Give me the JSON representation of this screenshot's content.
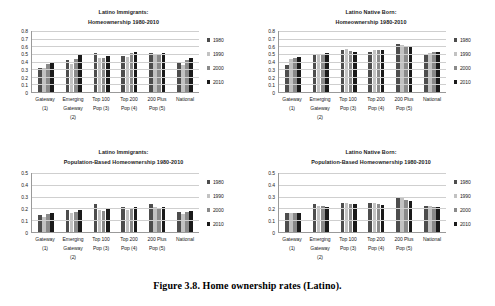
{
  "caption": "Figure 3.8.  Home ownership rates (Latino).",
  "series_colors": {
    "1980": "#4d4d4d",
    "1990": "#c2c2c2",
    "2000": "#8a8a8a",
    "2010": "#1a1a1a"
  },
  "legend": {
    "items": [
      {
        "label": "1980",
        "color": "#4d4d4d"
      },
      {
        "label": "1990",
        "color": "#c2c2c2"
      },
      {
        "label": "2000",
        "color": "#8a8a8a"
      },
      {
        "label": "2010",
        "color": "#1a1a1a"
      }
    ]
  },
  "categories": [
    [
      "Gateway",
      "(1)"
    ],
    [
      "Emerging",
      "Gateway",
      "(2)"
    ],
    [
      "Top 100",
      "Pop (3)"
    ],
    [
      "Top 200",
      "Pop (4)"
    ],
    [
      "200 Plus",
      "Pop (5)"
    ],
    [
      "National"
    ]
  ],
  "chart_data": [
    {
      "id": "latino-immigrants-homeownership",
      "type": "bar",
      "title": "Latino Immigrants: Homeownership 1980-2010",
      "title_lines": [
        "Latino Immigrants:",
        "Homeownership 1980-2010"
      ],
      "xlabel": "",
      "ylabel": "",
      "ylim": [
        0,
        0.8
      ],
      "yticks": [
        0.8,
        0.7,
        0.6,
        0.5,
        0.4,
        0.3,
        0.2,
        0.1,
        0
      ],
      "ytick_labels": [
        "0.8",
        "0.7",
        "0.6",
        "0.5",
        "0.4",
        "0.3",
        "0.2",
        "0.1",
        "0"
      ],
      "grid": true,
      "legend_position": "right",
      "categories": [
        "Gateway (1)",
        "Emerging Gateway (2)",
        "Top 100 Pop (3)",
        "Top 200 Pop (4)",
        "200 Plus Pop (5)",
        "National"
      ],
      "series": [
        {
          "name": "1980",
          "values": [
            0.32,
            0.42,
            0.51,
            0.47,
            0.51,
            0.39
          ]
        },
        {
          "name": "1990",
          "values": [
            0.31,
            0.37,
            0.45,
            0.46,
            0.5,
            0.35
          ]
        },
        {
          "name": "2000",
          "values": [
            0.37,
            0.43,
            0.45,
            0.51,
            0.49,
            0.42
          ]
        },
        {
          "name": "2010",
          "values": [
            0.4,
            0.48,
            0.47,
            0.52,
            0.51,
            0.44
          ]
        }
      ]
    },
    {
      "id": "latino-native-born-homeownership",
      "type": "bar",
      "title": "Latino Native Born: Homeownership 1980-2010",
      "title_lines": [
        "Latino Native Born:",
        "Homeownership 1980-2010"
      ],
      "xlabel": "",
      "ylabel": "",
      "ylim": [
        0,
        0.8
      ],
      "yticks": [
        0.8,
        0.7,
        0.6,
        0.5,
        0.4,
        0.3,
        0.2,
        0.1,
        0
      ],
      "ytick_labels": [
        "0.8",
        "0.7",
        "0.6",
        "0.5",
        "0.4",
        "0.3",
        "0.2",
        "0.1",
        "0"
      ],
      "grid": true,
      "legend_position": "right",
      "categories": [
        "Gateway (1)",
        "Emerging Gateway (2)",
        "Top 100 Pop (3)",
        "Top 200 Pop (4)",
        "200 Plus Pop (5)",
        "National"
      ],
      "series": [
        {
          "name": "1980",
          "values": [
            0.35,
            0.5,
            0.55,
            0.53,
            0.63,
            0.48
          ]
        },
        {
          "name": "1990",
          "values": [
            0.43,
            0.5,
            0.56,
            0.55,
            0.62,
            0.51
          ]
        },
        {
          "name": "2000",
          "values": [
            0.44,
            0.5,
            0.54,
            0.55,
            0.61,
            0.52
          ]
        },
        {
          "name": "2010",
          "values": [
            0.46,
            0.51,
            0.53,
            0.55,
            0.59,
            0.52
          ]
        }
      ]
    },
    {
      "id": "latino-immigrants-population-based",
      "type": "bar",
      "title": "Latino Immigrants: Population-Based Homeownership 1980-2010",
      "title_lines": [
        "Latino Immigrants:",
        "Population-Based Homeownership 1980-2010"
      ],
      "xlabel": "",
      "ylabel": "",
      "ylim": [
        0,
        0.5
      ],
      "yticks": [
        0.5,
        0.4,
        0.3,
        0.2,
        0.1,
        0
      ],
      "ytick_labels": [
        "0.5",
        "0.4",
        "0.3",
        "0.2",
        "0.1",
        "0"
      ],
      "grid": true,
      "legend_position": "right",
      "categories": [
        "Gateway (1)",
        "Emerging Gateway (2)",
        "Top 100 Pop (3)",
        "Top 200 Pop (4)",
        "200 Plus Pop (5)",
        "National"
      ],
      "series": [
        {
          "name": "1980",
          "values": [
            0.14,
            0.19,
            0.24,
            0.21,
            0.24,
            0.17
          ]
        },
        {
          "name": "1990",
          "values": [
            0.13,
            0.16,
            0.19,
            0.185,
            0.21,
            0.15
          ]
        },
        {
          "name": "2000",
          "values": [
            0.15,
            0.17,
            0.18,
            0.2,
            0.2,
            0.17
          ]
        },
        {
          "name": "2010",
          "values": [
            0.16,
            0.19,
            0.195,
            0.21,
            0.21,
            0.18
          ]
        }
      ]
    },
    {
      "id": "latino-native-born-population-based",
      "type": "bar",
      "title": "Latino Native Born: Population-Based Homeownership 1980-2010",
      "title_lines": [
        "Latino Native Born:",
        "Population-Based Homeownership 1980-2010"
      ],
      "xlabel": "",
      "ylabel": "",
      "ylim": [
        0,
        0.5
      ],
      "yticks": [
        0.5,
        0.4,
        0.3,
        0.2,
        0.1,
        0
      ],
      "ytick_labels": [
        "0.5",
        "0.4",
        "0.3",
        "0.2",
        "0.1",
        "0"
      ],
      "grid": true,
      "legend_position": "right",
      "categories": [
        "Gateway (1)",
        "Emerging Gateway (2)",
        "Top 100 Pop (3)",
        "Top 200 Pop (4)",
        "200 Plus Pop (5)",
        "National"
      ],
      "series": [
        {
          "name": "1980",
          "values": [
            0.16,
            0.24,
            0.25,
            0.245,
            0.29,
            0.22
          ]
        },
        {
          "name": "1990",
          "values": [
            0.16,
            0.22,
            0.25,
            0.245,
            0.285,
            0.22
          ]
        },
        {
          "name": "2000",
          "values": [
            0.16,
            0.22,
            0.24,
            0.24,
            0.275,
            0.215
          ]
        },
        {
          "name": "2010",
          "values": [
            0.16,
            0.21,
            0.235,
            0.23,
            0.26,
            0.21
          ]
        }
      ]
    }
  ]
}
